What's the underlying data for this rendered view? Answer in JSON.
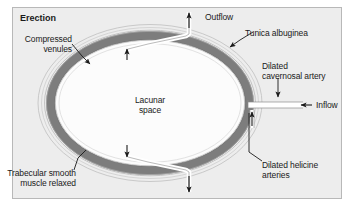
{
  "figure": {
    "title": "Erection",
    "background_color": "#ededed",
    "frame_color": "#b8b8b8",
    "page_color": "#ffffff",
    "ink_color": "#1a1a1a",
    "tunica_band_color": "#7f7f7f",
    "tunica_outline_color": "#9a9a9a",
    "lacunar_fill_color": "#fdfdfd",
    "channel_fill_color": "#ffffff"
  },
  "labels": {
    "title": "Erection",
    "outflow": "Outflow",
    "tunica_albuginea": "Tunica albuginea",
    "compressed_venules": "Compressed\nvenules",
    "dilated_cavernosal_artery": "Dilated\ncavernosal artery",
    "inflow": "Inflow",
    "lacunar_space": "Lacunar\nspace",
    "dilated_helicine_arteries": "Dilated helicine\narteries",
    "trabecular_smooth_muscle": "Trabecular smooth\nmuscle relaxed"
  },
  "diagram_data": {
    "type": "anatomical-cross-section",
    "subject": "Penile corpus cavernosum cross-section during erection",
    "ellipse": {
      "center_x": 150,
      "center_y": 103,
      "outer_rx": 112,
      "outer_ry": 78
    },
    "structures": [
      {
        "name": "tunica-albuginea",
        "description": "Thin outer fibrous sheath, light concentric lines",
        "label": "Tunica albuginea"
      },
      {
        "name": "compressed-venules",
        "description": "Dark gray thick band representing compressed subtunical venules",
        "label": "Compressed venules"
      },
      {
        "name": "lacunar-space",
        "description": "Large white central cavity expanded with blood",
        "label": "Lacunar space"
      },
      {
        "name": "trabecular-smooth-muscle",
        "description": "Relaxed smooth muscle lining the lacunar space",
        "label": "Trabecular smooth muscle relaxed"
      },
      {
        "name": "dilated-cavernosal-artery",
        "description": "White channel entering from right side of the ring",
        "label": "Dilated cavernosal artery"
      },
      {
        "name": "dilated-helicine-arteries",
        "description": "Branch channels delivering blood into lacunar space",
        "label": "Dilated helicine arteries"
      }
    ],
    "flow_arrows": [
      {
        "name": "outflow-top",
        "direction": "up",
        "label": "Outflow"
      },
      {
        "name": "outflow-bottom",
        "direction": "down",
        "label": ""
      },
      {
        "name": "inflow-right",
        "direction": "left",
        "label": "Inflow"
      },
      {
        "name": "venule-compression-upper",
        "direction": "up",
        "label": ""
      },
      {
        "name": "venule-compression-lower",
        "direction": "down",
        "label": ""
      },
      {
        "name": "helicine-inflow",
        "direction": "up",
        "label": ""
      }
    ]
  }
}
